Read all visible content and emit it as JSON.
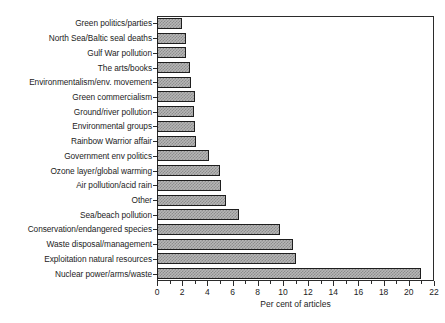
{
  "chart_data": {
    "type": "bar",
    "orientation": "horizontal",
    "title": "",
    "xlabel": "Per cent of articles",
    "ylabel": "",
    "xlim": [
      0,
      22
    ],
    "ylim": null,
    "grid": false,
    "legend": null,
    "xticks": [
      0,
      2,
      4,
      6,
      8,
      10,
      12,
      14,
      16,
      18,
      20,
      22
    ],
    "xtick_labels": [
      "0",
      "2",
      "4",
      "6",
      "8",
      "10",
      "12",
      "14",
      "16",
      "18",
      "20",
      "22"
    ],
    "xminor_ticks": [
      1,
      3,
      5,
      7,
      9,
      11,
      13,
      15,
      17,
      19,
      21
    ],
    "categories": [
      "Green politics/parties",
      "North Sea/Baltic seal deaths",
      "Gulf War pollution",
      "The arts/books",
      "Environmentalism/env. movement",
      "Green commercialism",
      "Ground/river pollution",
      "Environmental groups",
      "Rainbow Warrior affair",
      "Government env politics",
      "Ozone layer/global warming",
      "Air pollution/acid rain",
      "Other",
      "Sea/beach pollution",
      "Conservation/endangered species",
      "Waste disposal/management",
      "Exploitation natural resources",
      "Nuclear power/arms/waste"
    ],
    "values": [
      2.0,
      2.3,
      2.3,
      2.6,
      2.7,
      3.0,
      2.9,
      3.0,
      3.1,
      4.1,
      5.0,
      5.1,
      5.5,
      6.5,
      9.8,
      10.8,
      11.0,
      21.0
    ],
    "bar_fill_color": "#b6b6b6",
    "bar_pattern": "cross-hatch-dots",
    "bar_edge_color": "#1e1e1e",
    "axis_color": "#2b2b2b",
    "background_color": "#ffffff"
  }
}
